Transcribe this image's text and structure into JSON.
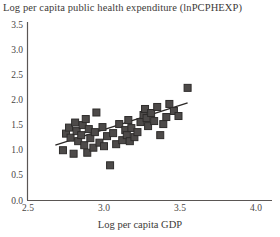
{
  "chart_data": {
    "type": "scatter",
    "title": "Log per capita public health expenditure (lnPCPHEXP)",
    "xlabel": "Log per capita GDP",
    "ylabel": "",
    "xlim": [
      2.5,
      4.0
    ],
    "ylim": [
      0.0,
      3.5
    ],
    "xticks": [
      "2.5",
      "3.0",
      "3.5",
      "4.0"
    ],
    "xtick_values": [
      2.5,
      3.0,
      3.5,
      4.0
    ],
    "yticks": [
      "0.0",
      "0.5",
      "1.0",
      "1.5",
      "2.0",
      "2.5",
      "3.0",
      "3.5"
    ],
    "ytick_values": [
      0.0,
      0.5,
      1.0,
      1.5,
      2.0,
      2.5,
      3.0,
      3.5
    ],
    "grid": false,
    "legend": null,
    "marker": {
      "shape": "square",
      "size_px": 7,
      "fill": "#4d4a49",
      "edge": "#2e2c2b"
    },
    "trendline": {
      "color": "#2b2826",
      "width_px": 1.3,
      "x_start": 2.68,
      "y_start": 1.1,
      "x_end": 3.55,
      "y_end": 1.94
    },
    "points": [
      {
        "x": 2.73,
        "y": 1.0
      },
      {
        "x": 2.75,
        "y": 1.33
      },
      {
        "x": 2.77,
        "y": 1.45
      },
      {
        "x": 2.78,
        "y": 1.25
      },
      {
        "x": 2.8,
        "y": 0.93
      },
      {
        "x": 2.81,
        "y": 1.55
      },
      {
        "x": 2.82,
        "y": 1.38
      },
      {
        "x": 2.83,
        "y": 1.18
      },
      {
        "x": 2.85,
        "y": 1.3
      },
      {
        "x": 2.86,
        "y": 1.5
      },
      {
        "x": 2.87,
        "y": 1.1
      },
      {
        "x": 2.88,
        "y": 1.62
      },
      {
        "x": 2.89,
        "y": 0.95
      },
      {
        "x": 2.9,
        "y": 1.42
      },
      {
        "x": 2.91,
        "y": 1.24
      },
      {
        "x": 2.93,
        "y": 1.05
      },
      {
        "x": 2.94,
        "y": 1.36
      },
      {
        "x": 2.95,
        "y": 1.75
      },
      {
        "x": 2.97,
        "y": 1.15
      },
      {
        "x": 2.99,
        "y": 1.46
      },
      {
        "x": 3.0,
        "y": 1.08
      },
      {
        "x": 3.02,
        "y": 1.28
      },
      {
        "x": 3.04,
        "y": 0.7
      },
      {
        "x": 3.06,
        "y": 1.34
      },
      {
        "x": 3.08,
        "y": 1.12
      },
      {
        "x": 3.1,
        "y": 1.52
      },
      {
        "x": 3.12,
        "y": 1.2
      },
      {
        "x": 3.14,
        "y": 1.4
      },
      {
        "x": 3.15,
        "y": 1.3
      },
      {
        "x": 3.16,
        "y": 1.6
      },
      {
        "x": 3.17,
        "y": 1.18
      },
      {
        "x": 3.18,
        "y": 1.44
      },
      {
        "x": 3.2,
        "y": 1.26
      },
      {
        "x": 3.22,
        "y": 1.36
      },
      {
        "x": 3.24,
        "y": 1.56
      },
      {
        "x": 3.26,
        "y": 1.7
      },
      {
        "x": 3.27,
        "y": 1.82
      },
      {
        "x": 3.28,
        "y": 1.64
      },
      {
        "x": 3.29,
        "y": 1.48
      },
      {
        "x": 3.31,
        "y": 1.74
      },
      {
        "x": 3.33,
        "y": 1.58
      },
      {
        "x": 3.35,
        "y": 1.86
      },
      {
        "x": 3.37,
        "y": 1.3
      },
      {
        "x": 3.39,
        "y": 1.52
      },
      {
        "x": 3.41,
        "y": 1.66
      },
      {
        "x": 3.43,
        "y": 1.92
      },
      {
        "x": 3.46,
        "y": 1.78
      },
      {
        "x": 3.49,
        "y": 1.68
      },
      {
        "x": 3.55,
        "y": 2.24
      }
    ]
  }
}
